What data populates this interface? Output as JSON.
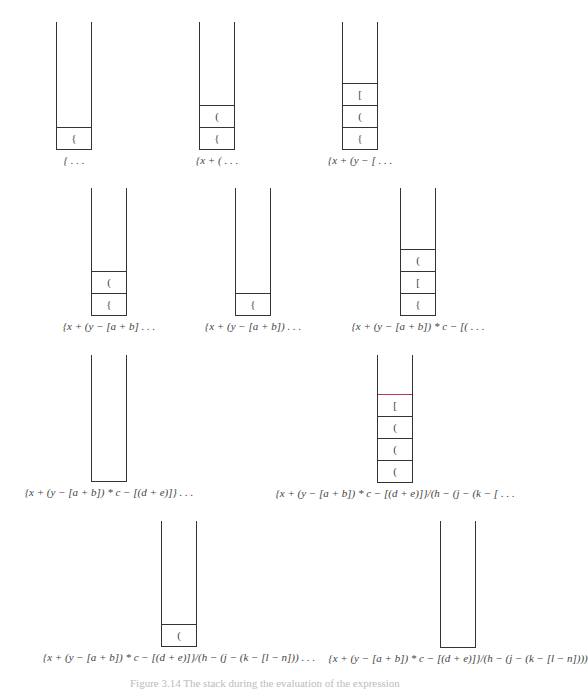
{
  "figure": {
    "caption": "Figure 3.14  The stack during the evaluation of the expression",
    "highlight_color": "#b8336a",
    "stacks": [
      {
        "id": 1,
        "x": 56,
        "top": 22,
        "bottom": 150,
        "cells": [
          "{"
        ],
        "label": "{ . . ."
      },
      {
        "id": 2,
        "x": 199,
        "top": 22,
        "bottom": 150,
        "cells": [
          "{",
          "("
        ],
        "label": "{x + ( . . ."
      },
      {
        "id": 3,
        "x": 342,
        "top": 22,
        "bottom": 150,
        "cells": [
          "{",
          "(",
          "["
        ],
        "label": "{x + (y − [ . . ."
      },
      {
        "id": 4,
        "x": 91,
        "top": 188,
        "bottom": 316,
        "cells": [
          "{",
          "("
        ],
        "label": "{x + (y − [a + b] . . ."
      },
      {
        "id": 5,
        "x": 235,
        "top": 188,
        "bottom": 316,
        "cells": [
          "{"
        ],
        "label": "{x + (y − [a + b]) . . ."
      },
      {
        "id": 6,
        "x": 400,
        "top": 188,
        "bottom": 316,
        "cells": [
          "{",
          "[",
          "("
        ],
        "label": "{x + (y − [a + b]) * c − [( . . ."
      },
      {
        "id": 7,
        "x": 91,
        "top": 355,
        "bottom": 482,
        "cells": [],
        "label": "{x + (y − [a + b]) * c − [(d + e)]} . . ."
      },
      {
        "id": 8,
        "x": 377,
        "top": 355,
        "bottom": 483,
        "cells": [
          "(",
          "(",
          "(",
          "["
        ],
        "highlight_index": 3,
        "label": "{x + (y − [a + b]) * c − [(d + e)]}/(h − (j − (k − [ . . ."
      },
      {
        "id": 9,
        "x": 161,
        "top": 521,
        "bottom": 647,
        "cells": [
          "("
        ],
        "label": "{x + (y − [a + b]) * c − [(d + e)]}/(h − (j − (k − [l − n])) . . ."
      },
      {
        "id": 10,
        "x": 440,
        "top": 521,
        "bottom": 648,
        "cells": [],
        "label": "{x + (y − [a + b]) * c − [(d + e)]}/(h − (j − (k − [l − n])))"
      }
    ]
  }
}
